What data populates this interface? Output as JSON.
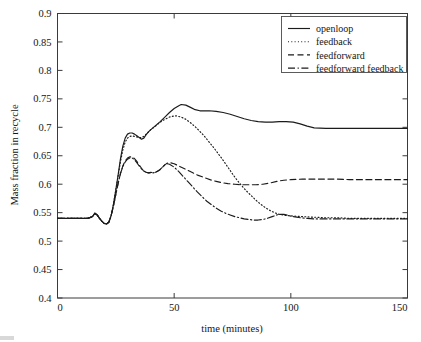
{
  "figure": {
    "background_color": "#ffffff",
    "line_color": "#1b1b1b",
    "axis_color": "#3a3a3a"
  },
  "chart_data": {
    "type": "line",
    "title": "",
    "xlabel": "time (minutes)",
    "ylabel": "Mass fraction in recycle",
    "xlim": [
      0,
      150
    ],
    "ylim": [
      0.4,
      0.9
    ],
    "xticks": [
      0,
      50,
      100,
      150
    ],
    "xtick_labels": [
      "0",
      "50",
      "100",
      "150"
    ],
    "yticks": [
      0.4,
      0.45,
      0.5,
      0.55,
      0.6,
      0.65,
      0.7,
      0.75,
      0.8,
      0.85,
      0.9
    ],
    "ytick_labels": [
      "0.4",
      "0.45",
      "0.5",
      "0.55",
      "0.6",
      "0.65",
      "0.7",
      "0.75",
      "0.8",
      "0.85",
      "0.9"
    ],
    "grid": false,
    "legend_position": "upper right",
    "series": [
      {
        "name": "openloop",
        "style": "solid",
        "dash": "none",
        "x": [
          0,
          5,
          10,
          13,
          15,
          16,
          17,
          18,
          19,
          20,
          21,
          22,
          23,
          24,
          25,
          26,
          27,
          28,
          29,
          30,
          31,
          32,
          33,
          34,
          35,
          36,
          37,
          38,
          39,
          40,
          42,
          44,
          46,
          48,
          50,
          52,
          53,
          55,
          57,
          59,
          61,
          63,
          65,
          68,
          71,
          74,
          77,
          80,
          83,
          86,
          89,
          92,
          95,
          98,
          101,
          104,
          107,
          110,
          115,
          120,
          125,
          130,
          135,
          140,
          145,
          150
        ],
        "y": [
          0.54,
          0.54,
          0.54,
          0.54,
          0.543,
          0.549,
          0.546,
          0.54,
          0.535,
          0.531,
          0.53,
          0.533,
          0.545,
          0.565,
          0.59,
          0.617,
          0.645,
          0.667,
          0.681,
          0.688,
          0.69,
          0.69,
          0.688,
          0.685,
          0.682,
          0.679,
          0.681,
          0.687,
          0.692,
          0.696,
          0.703,
          0.71,
          0.718,
          0.726,
          0.733,
          0.738,
          0.74,
          0.739,
          0.735,
          0.731,
          0.729,
          0.729,
          0.729,
          0.728,
          0.726,
          0.723,
          0.719,
          0.715,
          0.712,
          0.71,
          0.709,
          0.709,
          0.71,
          0.71,
          0.709,
          0.706,
          0.702,
          0.699,
          0.698,
          0.698,
          0.698,
          0.698,
          0.698,
          0.698,
          0.698,
          0.698
        ]
      },
      {
        "name": "feedback",
        "style": "dotted",
        "dash": "1,2.3",
        "x": [
          0,
          5,
          10,
          13,
          15,
          16,
          17,
          18,
          19,
          20,
          21,
          22,
          23,
          24,
          25,
          26,
          27,
          28,
          29,
          30,
          31,
          32,
          33,
          34,
          35,
          36,
          37,
          38,
          39,
          40,
          42,
          44,
          46,
          48,
          50,
          51,
          53,
          55,
          57,
          59,
          61,
          63,
          65,
          67,
          69,
          71,
          73,
          75,
          77,
          79,
          81,
          83,
          85,
          87,
          89,
          91,
          93,
          95,
          98,
          101,
          105,
          110,
          115,
          120,
          125,
          130,
          135,
          140,
          145,
          150
        ],
        "y": [
          0.54,
          0.54,
          0.54,
          0.54,
          0.543,
          0.549,
          0.546,
          0.54,
          0.535,
          0.531,
          0.53,
          0.533,
          0.545,
          0.565,
          0.59,
          0.615,
          0.64,
          0.66,
          0.674,
          0.681,
          0.684,
          0.685,
          0.684,
          0.683,
          0.682,
          0.682,
          0.684,
          0.688,
          0.692,
          0.696,
          0.702,
          0.709,
          0.714,
          0.718,
          0.72,
          0.72,
          0.718,
          0.714,
          0.708,
          0.701,
          0.693,
          0.684,
          0.674,
          0.664,
          0.653,
          0.642,
          0.63,
          0.618,
          0.607,
          0.597,
          0.588,
          0.58,
          0.572,
          0.565,
          0.559,
          0.554,
          0.55,
          0.547,
          0.545,
          0.544,
          0.543,
          0.542,
          0.541,
          0.541,
          0.54,
          0.54,
          0.54,
          0.54,
          0.54,
          0.54
        ]
      },
      {
        "name": "feedforward",
        "style": "dashed",
        "dash": "6,3.5",
        "x": [
          0,
          5,
          10,
          13,
          15,
          16,
          17,
          18,
          19,
          20,
          21,
          22,
          23,
          24,
          25,
          26,
          27,
          28,
          29,
          30,
          31,
          32,
          33,
          34,
          35,
          36,
          37,
          38,
          39,
          40,
          41,
          42,
          43,
          44,
          45,
          46,
          47,
          48,
          50,
          52,
          54,
          56,
          58,
          60,
          62,
          64,
          66,
          68,
          70,
          73,
          76,
          79,
          82,
          85,
          88,
          91,
          94,
          97,
          100,
          105,
          110,
          115,
          120,
          125,
          130,
          135,
          140,
          145,
          150
        ],
        "y": [
          0.54,
          0.54,
          0.54,
          0.54,
          0.543,
          0.549,
          0.546,
          0.54,
          0.535,
          0.531,
          0.53,
          0.533,
          0.545,
          0.562,
          0.582,
          0.602,
          0.619,
          0.632,
          0.641,
          0.646,
          0.648,
          0.648,
          0.645,
          0.64,
          0.634,
          0.628,
          0.623,
          0.621,
          0.62,
          0.621,
          0.62,
          0.621,
          0.623,
          0.626,
          0.63,
          0.634,
          0.637,
          0.638,
          0.636,
          0.632,
          0.628,
          0.624,
          0.62,
          0.616,
          0.613,
          0.61,
          0.607,
          0.605,
          0.603,
          0.601,
          0.6,
          0.599,
          0.599,
          0.599,
          0.6,
          0.602,
          0.605,
          0.607,
          0.608,
          0.609,
          0.609,
          0.609,
          0.609,
          0.608,
          0.608,
          0.608,
          0.608,
          0.608,
          0.608
        ]
      },
      {
        "name": "feedforward feedback",
        "style": "dashdot",
        "dash": "7,2.6,1.2,2.6",
        "x": [
          0,
          5,
          10,
          13,
          15,
          16,
          17,
          18,
          19,
          20,
          21,
          22,
          23,
          24,
          25,
          26,
          27,
          28,
          29,
          30,
          31,
          32,
          33,
          34,
          35,
          36,
          37,
          38,
          39,
          40,
          41,
          42,
          43,
          44,
          45,
          46,
          47,
          48,
          50,
          52,
          54,
          56,
          58,
          60,
          62,
          64,
          66,
          68,
          70,
          72,
          74,
          76,
          78,
          80,
          82,
          84,
          86,
          88,
          90,
          92,
          94,
          95,
          97,
          99,
          101,
          104,
          107,
          110,
          115,
          120,
          125,
          130,
          135,
          140,
          145,
          150
        ],
        "y": [
          0.54,
          0.54,
          0.54,
          0.54,
          0.543,
          0.549,
          0.546,
          0.54,
          0.535,
          0.531,
          0.53,
          0.533,
          0.545,
          0.562,
          0.582,
          0.602,
          0.619,
          0.631,
          0.639,
          0.644,
          0.646,
          0.646,
          0.643,
          0.638,
          0.632,
          0.627,
          0.623,
          0.621,
          0.62,
          0.62,
          0.62,
          0.621,
          0.623,
          0.626,
          0.63,
          0.634,
          0.636,
          0.635,
          0.63,
          0.622,
          0.613,
          0.604,
          0.595,
          0.586,
          0.578,
          0.57,
          0.564,
          0.558,
          0.553,
          0.549,
          0.546,
          0.543,
          0.541,
          0.539,
          0.538,
          0.537,
          0.537,
          0.538,
          0.54,
          0.543,
          0.546,
          0.547,
          0.547,
          0.545,
          0.543,
          0.541,
          0.54,
          0.539,
          0.539,
          0.539,
          0.539,
          0.539,
          0.539,
          0.539,
          0.539,
          0.539
        ]
      }
    ]
  },
  "legend": {
    "entries": [
      {
        "label": "openloop"
      },
      {
        "label": "feedback"
      },
      {
        "label": "feedforward"
      },
      {
        "label": "feedforward feedback"
      }
    ]
  }
}
